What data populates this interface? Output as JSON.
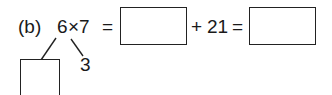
{
  "problem": {
    "label": "(b)",
    "factor_a": "6",
    "times": "×",
    "factor_b": "7",
    "equals_1": "=",
    "answer_box_1": "",
    "plus": "+",
    "addend": "21",
    "equals_2": "=",
    "answer_box_2": "",
    "split_left_box": "",
    "split_right": "3"
  }
}
